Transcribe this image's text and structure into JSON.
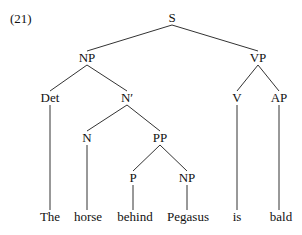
{
  "example_number": "(21)",
  "tree": {
    "nodes": [
      {
        "id": "S",
        "label": "S",
        "x": 172,
        "y": 18
      },
      {
        "id": "NP1",
        "label": "NP",
        "x": 87,
        "y": 58
      },
      {
        "id": "VP",
        "label": "VP",
        "x": 258,
        "y": 58
      },
      {
        "id": "Det",
        "label": "Det",
        "x": 50,
        "y": 98
      },
      {
        "id": "Nbar",
        "label": "N′",
        "x": 127,
        "y": 98
      },
      {
        "id": "V",
        "label": "V",
        "x": 237,
        "y": 98
      },
      {
        "id": "AP",
        "label": "AP",
        "x": 279,
        "y": 98
      },
      {
        "id": "N",
        "label": "N",
        "x": 87,
        "y": 138
      },
      {
        "id": "PP",
        "label": "PP",
        "x": 160,
        "y": 138
      },
      {
        "id": "P",
        "label": "P",
        "x": 133,
        "y": 178
      },
      {
        "id": "NP2",
        "label": "NP",
        "x": 187,
        "y": 178
      },
      {
        "id": "w1",
        "label": "The",
        "x": 50,
        "y": 217
      },
      {
        "id": "w2",
        "label": "horse",
        "x": 88,
        "y": 217
      },
      {
        "id": "w3",
        "label": "behind",
        "x": 135,
        "y": 217
      },
      {
        "id": "w4",
        "label": "Pegasus",
        "x": 188,
        "y": 217
      },
      {
        "id": "w5",
        "label": "is",
        "x": 237,
        "y": 217
      },
      {
        "id": "w6",
        "label": "bald",
        "x": 281,
        "y": 217
      }
    ],
    "edges": [
      [
        172,
        25,
        87,
        51
      ],
      [
        172,
        25,
        258,
        51
      ],
      [
        87,
        65,
        50,
        91
      ],
      [
        87,
        65,
        127,
        91
      ],
      [
        258,
        65,
        237,
        91
      ],
      [
        258,
        65,
        279,
        91
      ],
      [
        50,
        105,
        50,
        210
      ],
      [
        127,
        105,
        87,
        131
      ],
      [
        127,
        105,
        160,
        131
      ],
      [
        87,
        145,
        87,
        210
      ],
      [
        160,
        145,
        133,
        171
      ],
      [
        160,
        145,
        187,
        171
      ],
      [
        133,
        185,
        133,
        210
      ],
      [
        187,
        185,
        187,
        210
      ],
      [
        237,
        105,
        237,
        210
      ],
      [
        279,
        105,
        279,
        210
      ]
    ]
  }
}
